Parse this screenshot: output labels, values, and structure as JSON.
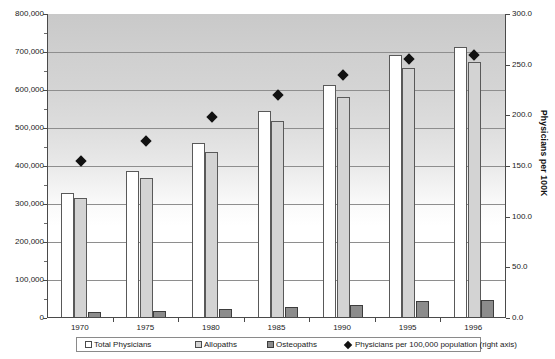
{
  "chart_data": {
    "type": "bar",
    "title": "",
    "xlabel": "",
    "ylabel": "",
    "categories": [
      "1970",
      "1975",
      "1980",
      "1985",
      "1990",
      "1995",
      "1996"
    ],
    "series": [
      {
        "name": "Total Physicians",
        "axis": "left",
        "type": "bar",
        "color": "#ffffff",
        "values": [
          326000,
          384000,
          457000,
          541000,
          610000,
          690000,
          711000
        ]
      },
      {
        "name": "Allopaths",
        "axis": "left",
        "type": "bar",
        "color": "#d3d3d3",
        "values": [
          313000,
          366000,
          435000,
          516000,
          580000,
          655000,
          672000
        ]
      },
      {
        "name": "Osteopaths",
        "axis": "left",
        "type": "bar",
        "color": "#8c8c8c",
        "values": [
          13000,
          15000,
          20000,
          26000,
          32000,
          42000,
          45000
        ]
      },
      {
        "name": "Physicians per 100,000 population (right axis)",
        "axis": "right",
        "type": "scatter",
        "color": "#111111",
        "values": [
          155.0,
          175.0,
          198.0,
          220.0,
          240.0,
          256.0,
          260.0
        ]
      }
    ],
    "left_axis": {
      "title": "",
      "min": 0,
      "max": 800000,
      "tick_step": 100000,
      "tick_labels": [
        "0",
        "100,000",
        "200,000",
        "300,000",
        "400,000",
        "500,000",
        "600,000",
        "700,000",
        "800,000"
      ],
      "tick_values": [
        0,
        100000,
        200000,
        300000,
        400000,
        500000,
        600000,
        700000,
        800000
      ]
    },
    "right_axis": {
      "title": "Physicians per 100K",
      "min": 0,
      "max": 300,
      "tick_step": 50,
      "tick_labels": [
        "0.0",
        "50.0",
        "100.0",
        "150.0",
        "200.0",
        "250.0",
        "300.0"
      ],
      "tick_values": [
        0,
        50,
        100,
        150,
        200,
        250,
        300
      ]
    },
    "grid": true,
    "legend_position": "bottom",
    "legend_entries": [
      {
        "label": "Total Physicians",
        "marker": "square-open"
      },
      {
        "label": "Allopaths",
        "marker": "square-light"
      },
      {
        "label": "Osteopaths",
        "marker": "square-dark"
      },
      {
        "label": "Physicians per 100,000 population (right axis)",
        "marker": "diamond"
      }
    ],
    "colors": {
      "total_physicians": "#ffffff",
      "allopaths": "#d3d3d3",
      "osteopaths": "#8c8c8c",
      "rate_marker": "#111111",
      "axis": "#4a4a4a",
      "gridline": "#8e8e8e"
    }
  }
}
